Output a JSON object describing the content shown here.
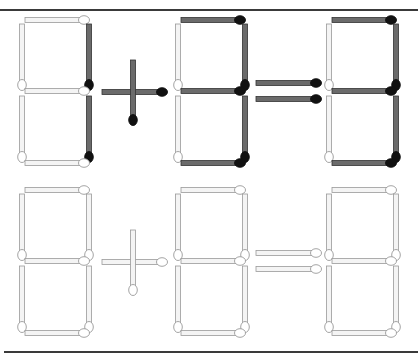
{
  "puzzle": {
    "type": "matchstick-equation",
    "colors": {
      "dark_stick": "#6b6b6b",
      "dark_stick_edge": "#333333",
      "dark_head": "#111111",
      "light_stick": "#f4f4f4",
      "light_stick_edge": "#9a9a9a",
      "light_head": "#ffffff",
      "frame": "#3a3a3a",
      "background": "#ffffff"
    },
    "rows": [
      {
        "name": "problem",
        "y_top": 20,
        "highlight": "dark",
        "equation_text": "1 + 3 = 3",
        "digits": [
          {
            "x_left": 22,
            "value": "1",
            "lit": [
              "b",
              "c"
            ]
          },
          {
            "x_left": 178,
            "value": "3",
            "lit": [
              "a",
              "b",
              "c",
              "d",
              "g"
            ]
          },
          {
            "x_left": 329,
            "value": "3",
            "lit": [
              "a",
              "b",
              "c",
              "d",
              "g"
            ]
          }
        ],
        "operator": "+",
        "equals": "="
      },
      {
        "name": "blank-template",
        "y_top": 190,
        "highlight": "none",
        "digits": [
          {
            "x_left": 22,
            "value": "8",
            "lit": []
          },
          {
            "x_left": 178,
            "value": "8",
            "lit": []
          },
          {
            "x_left": 329,
            "value": "8",
            "lit": []
          }
        ],
        "operator": "+",
        "equals": "="
      }
    ]
  }
}
